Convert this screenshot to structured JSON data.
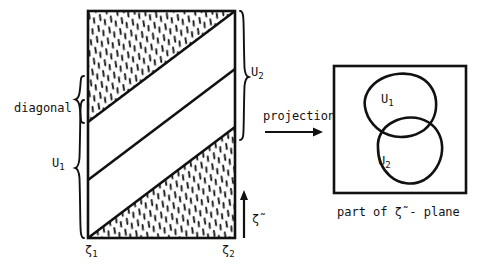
{
  "figure": {
    "title_none": "",
    "labels": {
      "diagonal": "diagonal",
      "u1_left": "U",
      "u1_left_sub": "1",
      "u2_right": "U",
      "u2_right_sub": "2",
      "zeta1": "ζ",
      "zeta1_sub": "1",
      "zeta2": "ζ",
      "zeta2_sub": "2",
      "zeta_tilde_axis": "ζ̃",
      "projection": "projection",
      "u1_blob": "U",
      "u1_blob_sub": "1",
      "u2_blob": "U",
      "u2_blob_sub": "2",
      "caption": "part of ζ̃ - plane"
    },
    "colors": {
      "ink": "#111111",
      "background": "#ffffff",
      "hatch": "#1a1a1a"
    },
    "geometry": {
      "strip_rect": {
        "x": 88,
        "y": 11,
        "width": 147,
        "height": 227
      },
      "projection_square": {
        "x": 334,
        "y": 66,
        "width": 132,
        "height": 127
      },
      "diagonal_count": 3,
      "hatched_regions": [
        "top-left-triangle",
        "bottom-right-triangle"
      ],
      "u1_brace_range_y": [
        100,
        238
      ],
      "u2_brace_range_y": [
        11,
        140
      ],
      "diagonal_brace_range_y": [
        95,
        172
      ],
      "zeta_axis_arrow": {
        "x": 244,
        "y_from": 238,
        "y_to": 192
      },
      "projection_arrow": {
        "y": 132,
        "x_from": 265,
        "x_to": 322
      }
    }
  }
}
